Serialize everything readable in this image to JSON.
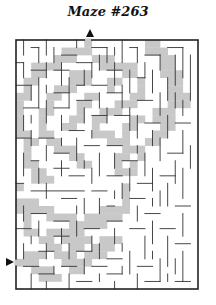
{
  "title": "Maze #263",
  "colors": {
    "background": "#ffffff",
    "wall": "#333333",
    "frame": "#222222",
    "solution_fill": "#c8c8c8",
    "arrow": "#111111"
  },
  "maze": {
    "frame": {
      "x": 16,
      "y": 40,
      "width": 182,
      "height": 249
    },
    "cols": 24,
    "rows": 33,
    "entrance": {
      "side": "top",
      "col": 9,
      "arrow": "up-triangle",
      "x": 90,
      "y": 33
    },
    "exit": {
      "side": "left",
      "row": 29,
      "arrow": "right-triangle",
      "x": 10,
      "y": 262
    },
    "shaded_spans": [
      [
        0,
        [
          [
            9,
            10
          ],
          [
            17,
            19
          ]
        ]
      ],
      [
        1,
        [
          [
            6,
            10
          ],
          [
            17,
            20
          ]
        ]
      ],
      [
        2,
        [
          [
            5,
            8
          ],
          [
            10,
            13
          ],
          [
            19,
            21
          ]
        ]
      ],
      [
        3,
        [
          [
            2,
            6
          ],
          [
            11,
            16
          ],
          [
            19,
            21
          ]
        ]
      ],
      [
        4,
        [
          [
            2,
            4
          ],
          [
            7,
            10
          ],
          [
            14,
            16
          ],
          [
            19,
            22
          ]
        ]
      ],
      [
        5,
        [
          [
            1,
            3
          ],
          [
            7,
            10
          ],
          [
            12,
            14
          ],
          [
            16,
            17
          ],
          [
            20,
            22
          ]
        ]
      ],
      [
        6,
        [
          [
            1,
            2
          ],
          [
            5,
            8
          ],
          [
            12,
            13
          ],
          [
            16,
            17
          ],
          [
            20,
            22
          ]
        ]
      ],
      [
        7,
        [
          [
            0,
            2
          ],
          [
            4,
            6
          ],
          [
            9,
            11
          ],
          [
            15,
            17
          ],
          [
            20,
            23
          ]
        ]
      ],
      [
        8,
        [
          [
            0,
            1
          ],
          [
            4,
            5
          ],
          [
            8,
            10
          ],
          [
            13,
            16
          ],
          [
            20,
            23
          ]
        ]
      ],
      [
        9,
        [
          [
            0,
            1
          ],
          [
            3,
            5
          ],
          [
            8,
            9
          ],
          [
            11,
            14
          ],
          [
            18,
            21
          ]
        ]
      ],
      [
        10,
        [
          [
            0,
            1
          ],
          [
            3,
            4
          ],
          [
            7,
            9
          ],
          [
            10,
            12
          ],
          [
            15,
            17
          ],
          [
            18,
            21
          ]
        ]
      ],
      [
        11,
        [
          [
            0,
            1
          ],
          [
            3,
            4
          ],
          [
            6,
            8
          ],
          [
            10,
            11
          ],
          [
            14,
            16
          ],
          [
            19,
            21
          ]
        ]
      ],
      [
        12,
        [
          [
            0,
            2
          ],
          [
            3,
            5
          ],
          [
            10,
            13
          ],
          [
            14,
            15
          ],
          [
            18,
            20
          ]
        ]
      ],
      [
        13,
        [
          [
            1,
            3
          ],
          [
            4,
            6
          ],
          [
            12,
            15
          ],
          [
            17,
            19
          ]
        ]
      ],
      [
        14,
        [
          [
            1,
            2
          ],
          [
            5,
            8
          ],
          [
            14,
            17
          ]
        ]
      ],
      [
        15,
        [
          [
            1,
            2
          ],
          [
            7,
            9
          ],
          [
            13,
            15
          ],
          [
            16,
            17
          ]
        ]
      ],
      [
        16,
        [
          [
            1,
            3
          ],
          [
            8,
            10
          ],
          [
            13,
            14
          ],
          [
            15,
            16
          ]
        ]
      ],
      [
        17,
        [
          [
            2,
            4
          ],
          [
            13,
            16
          ]
        ]
      ],
      [
        18,
        [
          [
            2,
            5
          ]
        ]
      ],
      [
        19,
        [
          [
            0,
            1
          ],
          [
            14,
            15
          ]
        ]
      ],
      [
        20,
        [
          [
            14,
            15
          ]
        ]
      ],
      [
        21,
        [
          [
            0,
            3
          ],
          [
            14,
            15
          ]
        ]
      ],
      [
        22,
        [
          [
            0,
            5
          ],
          [
            11,
            15
          ]
        ]
      ],
      [
        23,
        [
          [
            1,
            2
          ],
          [
            4,
            8
          ],
          [
            9,
            14
          ]
        ]
      ],
      [
        24,
        [
          [
            1,
            2
          ],
          [
            7,
            12
          ]
        ]
      ],
      [
        25,
        [
          [
            1,
            3
          ],
          [
            4,
            9
          ]
        ]
      ],
      [
        26,
        [
          [
            3,
            5
          ],
          [
            6,
            10
          ],
          [
            11,
            14
          ]
        ]
      ],
      [
        27,
        [
          [
            4,
            6
          ],
          [
            7,
            9
          ],
          [
            10,
            13
          ]
        ]
      ],
      [
        28,
        [
          [
            1,
            4
          ],
          [
            5,
            8
          ],
          [
            9,
            12
          ]
        ]
      ],
      [
        29,
        [
          [
            0,
            3
          ],
          [
            6,
            10
          ]
        ]
      ],
      [
        30,
        [
          [
            2,
            5
          ],
          [
            7,
            9
          ]
        ]
      ],
      [
        31,
        [
          [
            3,
            6
          ]
        ]
      ],
      [
        32,
        []
      ]
    ],
    "wall_segments": [
      [
        1,
        0,
        1,
        2
      ],
      [
        2,
        1,
        3,
        1
      ],
      [
        3,
        1,
        3,
        3
      ],
      [
        4,
        0,
        4,
        2
      ],
      [
        5,
        1,
        5,
        3
      ],
      [
        6,
        2,
        8,
        2
      ],
      [
        8,
        0,
        8,
        1
      ],
      [
        10,
        1,
        12,
        1
      ],
      [
        12,
        1,
        12,
        3
      ],
      [
        11,
        2,
        11,
        4
      ],
      [
        13,
        1,
        13,
        2
      ],
      [
        14,
        0,
        14,
        3
      ],
      [
        15,
        1,
        16,
        1
      ],
      [
        16,
        1,
        16,
        3
      ],
      [
        17,
        2,
        19,
        2
      ],
      [
        19,
        2,
        19,
        4
      ],
      [
        20,
        1,
        22,
        1
      ],
      [
        22,
        1,
        22,
        5
      ],
      [
        21,
        2,
        21,
        6
      ],
      [
        23,
        2,
        23,
        8
      ],
      [
        0,
        3,
        1,
        3
      ],
      [
        1,
        3,
        1,
        5
      ],
      [
        2,
        4,
        4,
        4
      ],
      [
        4,
        3,
        4,
        5
      ],
      [
        5,
        4,
        7,
        4
      ],
      [
        6,
        3,
        6,
        6
      ],
      [
        8,
        3,
        10,
        3
      ],
      [
        10,
        3,
        10,
        5
      ],
      [
        9,
        4,
        9,
        6
      ],
      [
        12,
        4,
        14,
        4
      ],
      [
        13,
        3,
        13,
        6
      ],
      [
        15,
        4,
        15,
        7
      ],
      [
        17,
        3,
        17,
        5
      ],
      [
        18,
        4,
        18,
        7
      ],
      [
        20,
        5,
        20,
        8
      ],
      [
        16,
        5,
        17,
        5
      ],
      [
        0,
        6,
        2,
        6
      ],
      [
        2,
        6,
        2,
        8
      ],
      [
        3,
        5,
        3,
        9
      ],
      [
        4,
        6,
        4,
        7
      ],
      [
        5,
        7,
        7,
        7
      ],
      [
        7,
        5,
        7,
        9
      ],
      [
        8,
        6,
        9,
        6
      ],
      [
        10,
        6,
        12,
        6
      ],
      [
        11,
        7,
        11,
        9
      ],
      [
        12,
        7,
        14,
        7
      ],
      [
        14,
        6,
        14,
        9
      ],
      [
        16,
        8,
        18,
        8
      ],
      [
        19,
        7,
        19,
        10
      ],
      [
        21,
        7,
        21,
        9
      ],
      [
        22,
        8,
        22,
        10
      ],
      [
        1,
        9,
        3,
        9
      ],
      [
        1,
        10,
        1,
        12
      ],
      [
        2,
        10,
        2,
        11
      ],
      [
        4,
        8,
        4,
        11
      ],
      [
        5,
        9,
        7,
        9
      ],
      [
        6,
        10,
        6,
        12
      ],
      [
        8,
        8,
        10,
        8
      ],
      [
        9,
        9,
        9,
        11
      ],
      [
        10,
        10,
        12,
        10
      ],
      [
        12,
        9,
        12,
        11
      ],
      [
        13,
        10,
        15,
        10
      ],
      [
        15,
        9,
        15,
        12
      ],
      [
        16,
        10,
        16,
        13
      ],
      [
        17,
        11,
        19,
        11
      ],
      [
        18,
        12,
        18,
        14
      ],
      [
        20,
        10,
        20,
        13
      ],
      [
        21,
        11,
        23,
        11
      ],
      [
        22,
        12,
        22,
        15
      ],
      [
        0,
        13,
        2,
        13
      ],
      [
        2,
        12,
        2,
        14
      ],
      [
        3,
        13,
        5,
        13
      ],
      [
        4,
        14,
        4,
        16
      ],
      [
        5,
        15,
        7,
        15
      ],
      [
        6,
        13,
        6,
        14
      ],
      [
        7,
        12,
        9,
        12
      ],
      [
        8,
        13,
        8,
        16
      ],
      [
        9,
        14,
        11,
        14
      ],
      [
        10,
        12,
        10,
        13
      ],
      [
        11,
        15,
        11,
        18
      ],
      [
        12,
        14,
        14,
        14
      ],
      [
        13,
        15,
        13,
        17
      ],
      [
        14,
        16,
        16,
        16
      ],
      [
        16,
        14,
        16,
        15
      ],
      [
        17,
        15,
        17,
        18
      ],
      [
        19,
        13,
        19,
        16
      ],
      [
        20,
        15,
        22,
        15
      ],
      [
        21,
        16,
        21,
        19
      ],
      [
        23,
        14,
        23,
        17
      ],
      [
        1,
        15,
        1,
        18
      ],
      [
        2,
        16,
        3,
        16
      ],
      [
        3,
        17,
        3,
        19
      ],
      [
        5,
        17,
        7,
        17
      ],
      [
        6,
        16,
        6,
        18
      ],
      [
        7,
        18,
        9,
        18
      ],
      [
        9,
        16,
        9,
        17
      ],
      [
        10,
        17,
        10,
        19
      ],
      [
        12,
        18,
        14,
        18
      ],
      [
        14,
        19,
        14,
        21
      ],
      [
        15,
        17,
        15,
        20
      ],
      [
        16,
        19,
        18,
        19
      ],
      [
        18,
        17,
        18,
        20
      ],
      [
        19,
        18,
        21,
        18
      ],
      [
        20,
        19,
        20,
        22
      ],
      [
        22,
        17,
        22,
        21
      ],
      [
        0,
        19,
        1,
        19
      ],
      [
        2,
        20,
        9,
        20
      ],
      [
        4,
        19,
        4,
        21
      ],
      [
        6,
        21,
        8,
        21
      ],
      [
        8,
        22,
        8,
        23
      ],
      [
        9,
        21,
        9,
        23
      ],
      [
        10,
        20,
        12,
        20
      ],
      [
        11,
        21,
        11,
        23
      ],
      [
        12,
        22,
        13,
        22
      ],
      [
        13,
        20,
        13,
        21
      ],
      [
        15,
        21,
        17,
        21
      ],
      [
        16,
        22,
        16,
        24
      ],
      [
        17,
        23,
        19,
        23
      ],
      [
        18,
        21,
        18,
        22
      ],
      [
        19,
        20,
        19,
        22
      ],
      [
        21,
        22,
        23,
        22
      ],
      [
        22,
        23,
        22,
        26
      ],
      [
        1,
        22,
        1,
        24
      ],
      [
        2,
        23,
        4,
        23
      ],
      [
        3,
        24,
        3,
        26
      ],
      [
        5,
        24,
        7,
        24
      ],
      [
        6,
        25,
        6,
        27
      ],
      [
        8,
        24,
        8,
        26
      ],
      [
        9,
        25,
        11,
        25
      ],
      [
        10,
        26,
        10,
        28
      ],
      [
        12,
        24,
        14,
        24
      ],
      [
        13,
        25,
        13,
        27
      ],
      [
        15,
        25,
        17,
        25
      ],
      [
        17,
        26,
        17,
        29
      ],
      [
        18,
        24,
        18,
        27
      ],
      [
        19,
        25,
        21,
        25
      ],
      [
        20,
        26,
        20,
        30
      ],
      [
        21,
        27,
        23,
        27
      ],
      [
        0,
        25,
        2,
        25
      ],
      [
        1,
        27,
        1,
        29
      ],
      [
        2,
        26,
        2,
        27
      ],
      [
        3,
        28,
        5,
        28
      ],
      [
        4,
        27,
        4,
        29
      ],
      [
        5,
        26,
        7,
        26
      ],
      [
        7,
        27,
        7,
        29
      ],
      [
        8,
        28,
        10,
        28
      ],
      [
        9,
        29,
        9,
        31
      ],
      [
        11,
        27,
        11,
        29
      ],
      [
        12,
        29,
        14,
        29
      ],
      [
        14,
        27,
        14,
        28
      ],
      [
        15,
        28,
        15,
        31
      ],
      [
        16,
        30,
        18,
        30
      ],
      [
        18,
        28,
        18,
        29
      ],
      [
        19,
        29,
        19,
        32
      ],
      [
        21,
        29,
        21,
        31
      ],
      [
        22,
        28,
        22,
        32
      ],
      [
        1,
        30,
        3,
        30
      ],
      [
        2,
        31,
        2,
        33
      ],
      [
        3,
        31,
        5,
        31
      ],
      [
        4,
        32,
        4,
        33
      ],
      [
        5,
        30,
        5,
        31
      ],
      [
        6,
        30,
        8,
        30
      ],
      [
        7,
        31,
        7,
        33
      ],
      [
        8,
        32,
        10,
        32
      ],
      [
        10,
        30,
        12,
        30
      ],
      [
        11,
        31,
        11,
        32
      ],
      [
        12,
        31,
        14,
        31
      ],
      [
        13,
        32,
        13,
        33
      ],
      [
        14,
        30,
        14,
        31
      ],
      [
        16,
        31,
        16,
        33
      ],
      [
        17,
        32,
        19,
        32
      ],
      [
        20,
        31,
        20,
        32
      ],
      [
        21,
        32,
        23,
        32
      ]
    ]
  }
}
